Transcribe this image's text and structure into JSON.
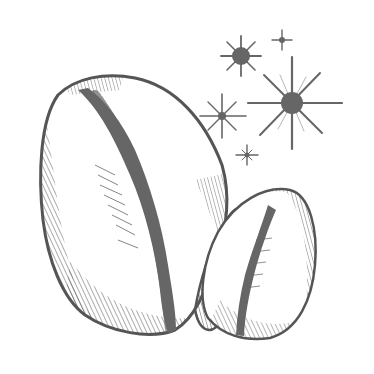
{
  "image": {
    "subject": "Cowrie shells with sparkles illustration",
    "style": "pen-and-ink engraving",
    "colors": {
      "background": "#ffffff",
      "ink": "#555555",
      "dark_fill": "#666666"
    },
    "elements": [
      {
        "name": "large-cowrie-shell",
        "position": "left-center"
      },
      {
        "name": "small-cowrie-shell",
        "position": "right-bottom"
      },
      {
        "name": "sparkle-large",
        "position": "top-right"
      },
      {
        "name": "sparkle-medium",
        "position": "top-center"
      },
      {
        "name": "sparkle-small",
        "position": "middle-right"
      },
      {
        "name": "sparkle-tiny",
        "position": "top-right"
      },
      {
        "name": "sparkle-tiny-2",
        "position": "lower-right"
      }
    ]
  }
}
